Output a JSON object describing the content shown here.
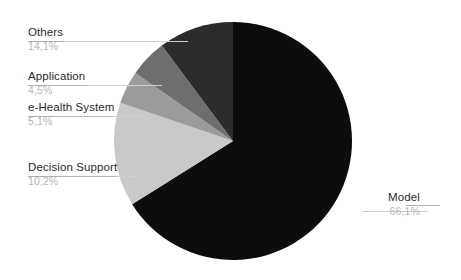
{
  "chart_data": {
    "type": "pie",
    "title": "",
    "subtitle": "",
    "xlabel": "",
    "ylabel": "",
    "legend_position": "none",
    "grid": false,
    "labels_show_percent": true,
    "decimal_separator": ",",
    "start_angle_deg": 0,
    "direction": "clockwise",
    "categories": [
      "Model",
      "Others",
      "Application",
      "e-Health System",
      "Decision Support"
    ],
    "values": [
      66.1,
      14.1,
      4.5,
      5.1,
      10.2
    ],
    "slices": [
      {
        "name": "Model",
        "value": 66.1,
        "percent_text": "66,1%",
        "color": "#0d0d0d",
        "label_position": "right",
        "label_left": 388,
        "label_top": 191,
        "leader_x": 362,
        "leader_y": 211,
        "leader_w": 66,
        "underline_x": 406,
        "underline_y": 205,
        "underline_w": 34
      },
      {
        "name": "Others",
        "value": 14.1,
        "percent_text": "14,1%",
        "color": "#c9c9c9",
        "label_position": "left",
        "label_left": 28,
        "label_top": 26,
        "leader_x": 28,
        "leader_y": 41,
        "leader_w": 160,
        "underline_x": 28,
        "underline_y": 41,
        "underline_w": 36
      },
      {
        "name": "Application",
        "value": 4.5,
        "percent_text": "4,5%",
        "color": "#9b9b9b",
        "label_position": "left",
        "label_left": 28,
        "label_top": 70,
        "leader_x": 28,
        "leader_y": 85,
        "leader_w": 134,
        "underline_x": 28,
        "underline_y": 85,
        "underline_w": 59
      },
      {
        "name": "e-Health System",
        "value": 5.1,
        "percent_text": "5,1%",
        "color": "#6e6e6e",
        "label_position": "left",
        "label_left": 28,
        "label_top": 101,
        "leader_x": 28,
        "leader_y": 116,
        "leader_w": 117,
        "underline_x": 28,
        "underline_y": 116,
        "underline_w": 85
      },
      {
        "name": "Decision Support",
        "value": 10.2,
        "percent_text": "10,2%",
        "color": "#2c2c2c",
        "label_position": "left",
        "label_left": 28,
        "label_top": 161,
        "leader_x": 28,
        "leader_y": 176,
        "leader_w": 113,
        "underline_x": 28,
        "underline_y": 176,
        "underline_w": 88
      }
    ],
    "geometry": {
      "center_x": 233,
      "center_y": 141,
      "radius": 119
    },
    "colors": {
      "background": "#ffffff",
      "label_text": "#2a2a2a",
      "percent_text": "#b7b7b7",
      "leader_line": "#cfcfcf"
    }
  }
}
